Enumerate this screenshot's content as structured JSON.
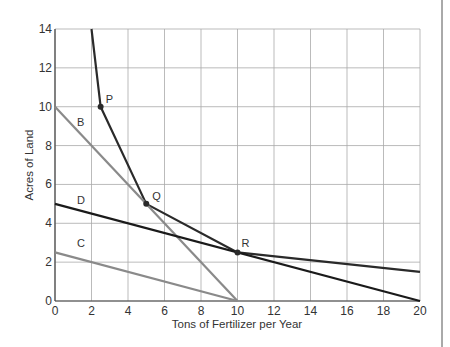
{
  "chart_data": {
    "type": "line",
    "title": "",
    "xlabel": "Tons of Fertilizer per Year",
    "ylabel": "Acres of Land",
    "xlim": [
      0,
      20
    ],
    "ylim": [
      0,
      14
    ],
    "x_ticks": [
      "0",
      "2",
      "4",
      "6",
      "8",
      "10",
      "12",
      "14",
      "16",
      "18",
      "20"
    ],
    "y_ticks": [
      "0",
      "2",
      "4",
      "6",
      "8",
      "10",
      "12",
      "14"
    ],
    "grid": true,
    "legend": "none",
    "series": [
      {
        "name": "Isoquant",
        "color": "#2a2a2a",
        "points": [
          [
            2.0,
            14
          ],
          [
            2.5,
            10
          ],
          [
            5,
            5
          ],
          [
            10,
            2.5
          ],
          [
            20,
            1.5
          ]
        ]
      },
      {
        "name": "B",
        "color": "#8a8a8a",
        "points": [
          [
            0,
            10
          ],
          [
            10,
            0
          ]
        ]
      },
      {
        "name": "C",
        "color": "#8a8a8a",
        "points": [
          [
            0,
            2.5
          ],
          [
            10,
            0
          ]
        ]
      },
      {
        "name": "D",
        "color": "#1a1a1a",
        "points": [
          [
            0,
            5
          ],
          [
            20,
            0
          ]
        ]
      }
    ],
    "annotations": [
      {
        "label": "P",
        "x": 2.5,
        "y": 10
      },
      {
        "label": "Q",
        "x": 5,
        "y": 5
      },
      {
        "label": "R",
        "x": 10,
        "y": 2.5
      },
      {
        "label": "B",
        "x": 1.2,
        "y": 9.0
      },
      {
        "label": "C",
        "x": 1.2,
        "y": 2.8
      },
      {
        "label": "D",
        "x": 1.2,
        "y": 5.0
      }
    ]
  }
}
